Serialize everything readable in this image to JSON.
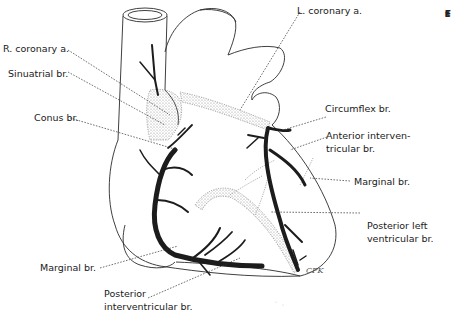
{
  "figure": {
    "signature": "CPK"
  },
  "labels": {
    "r_coronary": "R. coronary a.",
    "sinuatrial": "Sinuatrial br.",
    "conus": "Conus br.",
    "l_coronary": "L. coronary a.",
    "circumflex": "Circumflex br.",
    "anterior_interv_1": "Anterior interven-",
    "anterior_interv_2": "tricular br.",
    "marginal_right": "Marginal br.",
    "post_left_1": "Posterior left",
    "post_left_2": "ventricular br.",
    "marginal_left": "Marginal br.",
    "post_interv_1": "Posterior",
    "post_interv_2": "interventricular br."
  },
  "cutoff_text": [
    "F",
    "s",
    "t",
    "I",
    "4",
    "L"
  ],
  "colors": {
    "artery": "#1c1c1c",
    "outline": "#2a2a2a",
    "leader": "#333333",
    "stipple": "#9a9a9a"
  }
}
